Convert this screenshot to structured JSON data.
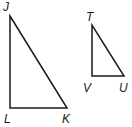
{
  "figure": {
    "stroke_color": "#1a1a1a",
    "background": "#ffffff"
  },
  "triangles": [
    {
      "name": "JLK",
      "vertices": {
        "J": {
          "label": "J",
          "x": 10,
          "y": 16
        },
        "L": {
          "label": "L",
          "x": 10,
          "y": 108
        },
        "K": {
          "label": "K",
          "x": 67,
          "y": 108
        }
      },
      "right_angle_at": "L"
    },
    {
      "name": "TVU",
      "vertices": {
        "T": {
          "label": "T",
          "x": 92,
          "y": 25
        },
        "V": {
          "label": "V",
          "x": 92,
          "y": 76
        },
        "U": {
          "label": "U",
          "x": 124,
          "y": 76
        }
      },
      "right_angle_at": "V"
    }
  ],
  "labels": {
    "J": "J",
    "L": "L",
    "K": "K",
    "T": "T",
    "V": "V",
    "U": "U"
  }
}
